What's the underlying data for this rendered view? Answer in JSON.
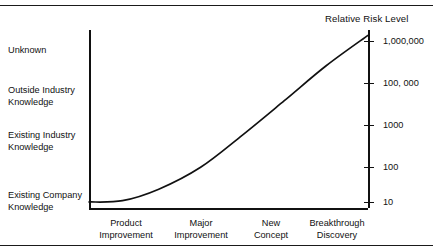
{
  "figure": {
    "clipped_caption": "",
    "title": "Relative Risk Level"
  },
  "chart_data": {
    "type": "line",
    "title": "Relative Risk Level",
    "xlabel": "",
    "ylabel": "Relative Risk Level",
    "grid": false,
    "legend": null,
    "categories": [
      "Product Improvement",
      "Major Improvement",
      "New Concept",
      "Breakthrough Discovery"
    ],
    "x_tick_labels": [
      {
        "line1": "Product",
        "line2": "Improvement"
      },
      {
        "line1": "Major",
        "line2": "Improvement"
      },
      {
        "line1": "New",
        "line2": "Concept"
      },
      {
        "line1": "Breakthrough",
        "line2": "Discovery"
      }
    ],
    "left_axis": {
      "type": "categorical",
      "label": "Knowledge Required",
      "tick_labels": [
        {
          "line1": "Unknown",
          "line2": ""
        },
        {
          "line1": "Outside Industry",
          "line2": "Knowledge"
        },
        {
          "line1": "Existing Industry",
          "line2": "Knowledge"
        },
        {
          "line1": "Existing Company",
          "line2": "Knowledge"
        }
      ]
    },
    "right_axis": {
      "type": "log",
      "label": "Relative Risk Level",
      "tick_labels": [
        "1,000,000",
        "100, 000",
        "1000",
        "100",
        "10"
      ],
      "tick_values": [
        1000000,
        100000,
        1000,
        100,
        10
      ]
    },
    "series": [
      {
        "name": "Relative Risk",
        "values": [
          10,
          300,
          30000,
          1500000
        ],
        "points": [
          {
            "x": 0.0,
            "y": 10
          },
          {
            "x": 0.12,
            "y": 11
          },
          {
            "x": 0.25,
            "y": 25
          },
          {
            "x": 0.4,
            "y": 120
          },
          {
            "x": 0.55,
            "y": 1200
          },
          {
            "x": 0.7,
            "y": 14000
          },
          {
            "x": 0.85,
            "y": 170000
          },
          {
            "x": 1.0,
            "y": 1500000
          }
        ]
      }
    ]
  },
  "colors": {
    "curve": "#111111",
    "axis": "#111111",
    "text": "#111111",
    "rule": "#1a1a1a",
    "background": "#ffffff"
  }
}
